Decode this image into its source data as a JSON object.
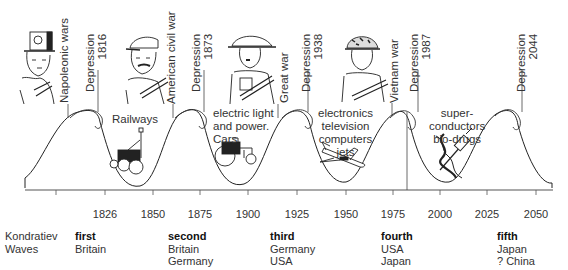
{
  "title": "Kondratiev Waves",
  "legend_label": [
    "Kondratiev",
    "Waves"
  ],
  "axis": {
    "ticks": [
      "1826",
      "1850",
      "1875",
      "1900",
      "1925",
      "1950",
      "1975",
      "2000",
      "2025",
      "2050"
    ]
  },
  "events": [
    {
      "label": "Napoleonic wars"
    },
    {
      "label": "Depression",
      "year": "1816"
    },
    {
      "label": "American civil war"
    },
    {
      "label": "Depression",
      "year": "1873"
    },
    {
      "label": "Great war"
    },
    {
      "label": "Depression",
      "year": "1938"
    },
    {
      "label": "Vietnam war"
    },
    {
      "label": "Depression",
      "year": "1987"
    },
    {
      "label": "Depression",
      "year": "2044"
    }
  ],
  "technologies": [
    {
      "lines": [
        "Railways"
      ]
    },
    {
      "lines": [
        "electric light",
        "and power.",
        "Cars"
      ]
    },
    {
      "lines": [
        "electronics",
        "television",
        "computers",
        "jets"
      ]
    },
    {
      "lines": [
        "super-",
        "conductors",
        "bio-drugs"
      ]
    }
  ],
  "waves": [
    {
      "ordinal": "first",
      "countries": [
        "Britain"
      ]
    },
    {
      "ordinal": "second",
      "countries": [
        "Britain",
        "Germany"
      ]
    },
    {
      "ordinal": "third",
      "countries": [
        "Germany",
        "USA"
      ]
    },
    {
      "ordinal": "fourth",
      "countries": [
        "USA",
        "Japan"
      ]
    },
    {
      "ordinal": "fifth",
      "countries": [
        "Japan",
        "? China"
      ]
    }
  ],
  "figures": [
    {
      "icon": "napoleonic-soldier-icon"
    },
    {
      "icon": "civil-war-soldier-icon"
    },
    {
      "icon": "ww1-soldier-icon"
    },
    {
      "icon": "vietnam-soldier-icon"
    }
  ]
}
